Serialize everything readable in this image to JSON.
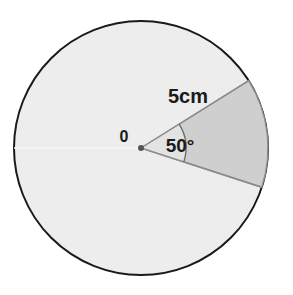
{
  "figure": {
    "background_color": "#ffffff",
    "circle": {
      "name": "circle",
      "center_x": 141,
      "center_y": 148,
      "radius": 127,
      "fill_color": "#ededed",
      "stroke_color": "#1a1a1a",
      "stroke_width": 2
    },
    "sector": {
      "name": "shaded-sector",
      "start_angle_deg": -32,
      "end_angle_deg": 18,
      "sweep_deg": 50,
      "fill_color": "#cfcfcf",
      "stroke_color": "#8c8c8c",
      "stroke_width": 1.4
    },
    "inner_wedge": {
      "name": "angle-inner-wedge",
      "radius": 45,
      "fill_color": "#e3e3e3"
    },
    "angle_arc": {
      "name": "angle-arc",
      "radius": 45,
      "stroke_color": "#6e6e6e",
      "stroke_width": 1.4
    },
    "equator_line": {
      "name": "horizontal-seam",
      "stroke_color": "#f5f5f5",
      "stroke_width": 1.5
    },
    "center_dot": {
      "name": "center-point",
      "radius": 3,
      "fill_color": "#555555"
    },
    "labels": {
      "radius_label": {
        "text": "5cm",
        "x": 188,
        "y": 98
      },
      "angle_label": {
        "text": "50°",
        "x": 180,
        "y": 147
      },
      "center_label": {
        "text": "0",
        "x": 124,
        "y": 138
      }
    }
  }
}
